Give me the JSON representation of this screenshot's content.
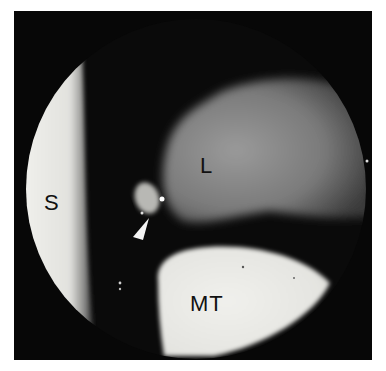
{
  "figure": {
    "labels": {
      "S": "S",
      "L": "L",
      "MT": "MT"
    },
    "annotations": {
      "arrowhead": "arrowhead-pointer"
    },
    "colors": {
      "background": "#ffffff",
      "frame": "#070707",
      "bright_surface": "#eeeeea",
      "tissue_grey": "#8a8a8a",
      "label_text": "#111111"
    }
  }
}
